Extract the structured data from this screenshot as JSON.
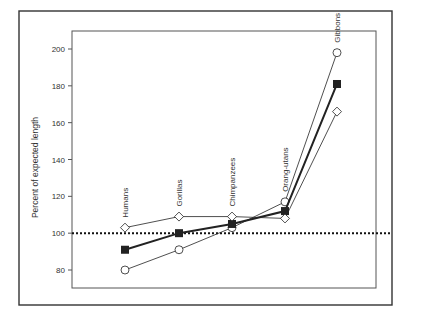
{
  "chart_data": {
    "type": "line",
    "title": "",
    "xlabel": "",
    "ylabel": "Percent of expected length",
    "ylim": [
      70,
      210
    ],
    "yticks": [
      80,
      100,
      120,
      140,
      160,
      180,
      200
    ],
    "categories": [
      "Humans",
      "Gorillas",
      "Chimpanzees",
      "Orang-utans",
      "Gibbons"
    ],
    "reference_line": {
      "value": 100,
      "style": "dotted"
    },
    "legend": null,
    "series": [
      {
        "name": "open-circle series",
        "marker": "circle",
        "filled": false,
        "line_weight": "thin",
        "values": [
          80,
          91,
          103,
          117,
          198
        ]
      },
      {
        "name": "filled-square series",
        "marker": "square",
        "filled": true,
        "line_weight": "thick",
        "values": [
          91,
          100,
          105,
          112,
          181
        ]
      },
      {
        "name": "open-diamond series",
        "marker": "diamond",
        "filled": false,
        "line_weight": "thin",
        "values": [
          103,
          109,
          109,
          108,
          166
        ]
      }
    ],
    "grid": false
  },
  "layout": {
    "frame": {
      "x": 19,
      "y": 11,
      "w": 174,
      "h": 129
    },
    "plot": {
      "x": 72,
      "y": 31,
      "w": 104,
      "h": 95
    },
    "y_px": {
      "v200": 49,
      "v80": 270
    },
    "x_px": [
      125,
      179,
      232,
      285,
      337
    ],
    "label_offset": 26,
    "colors": {
      "ink": "#222222",
      "frame": "#333333",
      "axis": "#555555",
      "marker_fill": "#ffffff"
    }
  }
}
